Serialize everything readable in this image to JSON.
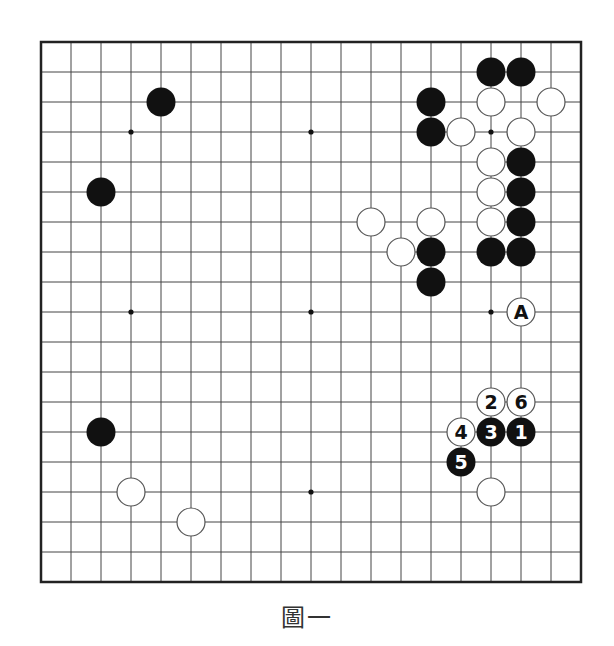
{
  "diagram": {
    "type": "go-board",
    "size": 19,
    "origin": [
      41,
      42
    ],
    "spacing": 30,
    "stone_radius": 14.5,
    "colors": {
      "line": "#444444",
      "border": "#222222",
      "black": "#111111",
      "white": "#ffffff",
      "white_stroke": "#555555"
    },
    "star_points": [
      [
        3,
        3
      ],
      [
        9,
        3
      ],
      [
        15,
        3
      ],
      [
        3,
        9
      ],
      [
        9,
        9
      ],
      [
        15,
        9
      ],
      [
        3,
        15
      ],
      [
        9,
        15
      ],
      [
        15,
        15
      ]
    ],
    "stones": [
      {
        "color": "black",
        "col": 4,
        "row": 2
      },
      {
        "color": "black",
        "col": 2,
        "row": 5
      },
      {
        "color": "black",
        "col": 2,
        "row": 13
      },
      {
        "color": "white",
        "col": 3,
        "row": 15
      },
      {
        "color": "white",
        "col": 5,
        "row": 16
      },
      {
        "color": "black",
        "col": 15,
        "row": 1
      },
      {
        "color": "black",
        "col": 16,
        "row": 1
      },
      {
        "color": "black",
        "col": 13,
        "row": 2
      },
      {
        "color": "white",
        "col": 15,
        "row": 2
      },
      {
        "color": "white",
        "col": 17,
        "row": 2
      },
      {
        "color": "black",
        "col": 13,
        "row": 3
      },
      {
        "color": "white",
        "col": 14,
        "row": 3
      },
      {
        "color": "white",
        "col": 16,
        "row": 3
      },
      {
        "color": "white",
        "col": 15,
        "row": 4
      },
      {
        "color": "black",
        "col": 16,
        "row": 4
      },
      {
        "color": "white",
        "col": 15,
        "row": 5
      },
      {
        "color": "black",
        "col": 16,
        "row": 5
      },
      {
        "color": "white",
        "col": 11,
        "row": 6
      },
      {
        "color": "white",
        "col": 13,
        "row": 6
      },
      {
        "color": "white",
        "col": 15,
        "row": 6
      },
      {
        "color": "black",
        "col": 16,
        "row": 6
      },
      {
        "color": "white",
        "col": 12,
        "row": 7
      },
      {
        "color": "black",
        "col": 13,
        "row": 7
      },
      {
        "color": "black",
        "col": 15,
        "row": 7
      },
      {
        "color": "black",
        "col": 16,
        "row": 7
      },
      {
        "color": "black",
        "col": 13,
        "row": 8
      },
      {
        "color": "white",
        "col": 16,
        "row": 9,
        "label": "A"
      },
      {
        "color": "white",
        "col": 15,
        "row": 12,
        "label": "2"
      },
      {
        "color": "white",
        "col": 16,
        "row": 12,
        "label": "6"
      },
      {
        "color": "white",
        "col": 14,
        "row": 13,
        "label": "4"
      },
      {
        "color": "black",
        "col": 15,
        "row": 13,
        "label": "3"
      },
      {
        "color": "black",
        "col": 16,
        "row": 13,
        "label": "1"
      },
      {
        "color": "black",
        "col": 14,
        "row": 14,
        "label": "5"
      },
      {
        "color": "white",
        "col": 15,
        "row": 15
      }
    ]
  },
  "caption": "圖一"
}
